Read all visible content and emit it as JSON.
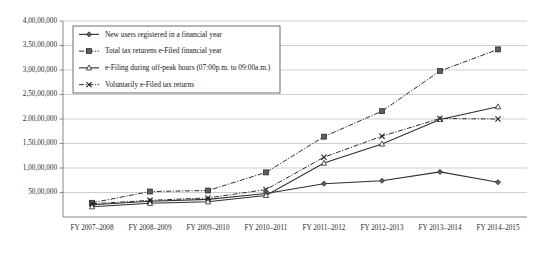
{
  "chart_data": {
    "type": "line",
    "title": "",
    "subtitle": "",
    "xlabel": "",
    "ylabel": "",
    "grid": "horizontal",
    "legend_position": "inside-top-left",
    "ylim": [
      0,
      40000000
    ],
    "ytick_values": [
      5000000,
      10000000,
      15000000,
      20000000,
      25000000,
      30000000,
      35000000,
      40000000
    ],
    "ytick_labels": [
      "50,00,000",
      "1,00,00,000",
      "1,50,00,000",
      "2,00,00,000",
      "2,50,00,000",
      "3,00,00,000",
      "3,50,00,000",
      "4,00,00,000"
    ],
    "categories": [
      "FY 2007–2008",
      "FY 2008–2009",
      "FY 2009–2010",
      "FY 2010–2011",
      "FY 2011–2012",
      "FY 2012–2013",
      "FY 2013–2014",
      "FY 2014–2015"
    ],
    "series": [
      {
        "name": "New users registered in a financial year",
        "marker": "diamond",
        "dash": "solid",
        "values": [
          2500000,
          3200000,
          3600000,
          4800000,
          6800000,
          7400000,
          9200000,
          7100000
        ]
      },
      {
        "name": "Total tax returens e-Filed financial year",
        "marker": "square",
        "dash": "dash-dot",
        "values": [
          2900000,
          5200000,
          5400000,
          9100000,
          16400000,
          21600000,
          29800000,
          34200000
        ]
      },
      {
        "name": "e-Filing during off-peak hours (07:00p.m. to 09:00a.m.)",
        "marker": "triangle",
        "dash": "solid",
        "values": [
          2100000,
          2800000,
          3100000,
          4400000,
          11000000,
          14900000,
          19900000,
          22500000
        ]
      },
      {
        "name": "Voluntarily e-Filed tax returns",
        "marker": "x",
        "dash": "dash-dot",
        "values": [
          2700000,
          3400000,
          3900000,
          5600000,
          12200000,
          16500000,
          20100000,
          20000000
        ]
      }
    ]
  }
}
